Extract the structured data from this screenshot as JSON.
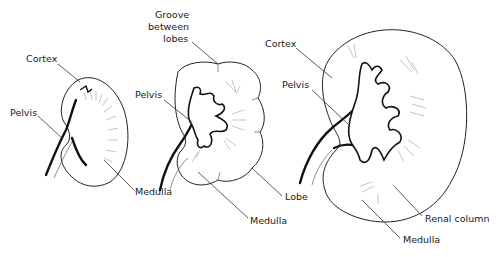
{
  "diagram": {
    "kidneys": [
      {
        "id": "fetal",
        "labels": {
          "cortex": "Cortex",
          "pelvis": "Pelvis",
          "medulla": "Medulla"
        }
      },
      {
        "id": "lobulated",
        "labels": {
          "groove_line1": "Groove",
          "groove_line2": "between",
          "groove_line3": "lobes",
          "pelvis": "Pelvis",
          "lobe": "Lobe",
          "medulla": "Medulla"
        }
      },
      {
        "id": "adult",
        "labels": {
          "cortex": "Cortex",
          "pelvis": "Pelvis",
          "renal_column": "Renal column",
          "medulla": "Medulla"
        }
      }
    ]
  }
}
